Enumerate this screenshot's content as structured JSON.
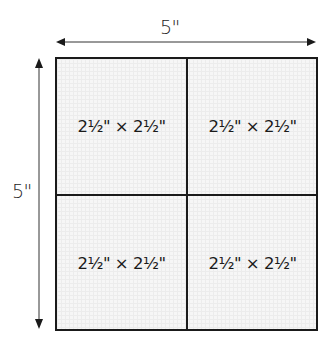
{
  "diagram": {
    "width_label": "5\"",
    "height_label": "5\"",
    "cells": [
      {
        "label": "2½\" × 2½\""
      },
      {
        "label": "2½\" × 2½\""
      },
      {
        "label": "2½\" × 2½\""
      },
      {
        "label": "2½\" × 2½\""
      }
    ],
    "colors": {
      "line": "#1a1a1a",
      "fill": "#f6f6f6",
      "grid": "#ececec"
    }
  }
}
